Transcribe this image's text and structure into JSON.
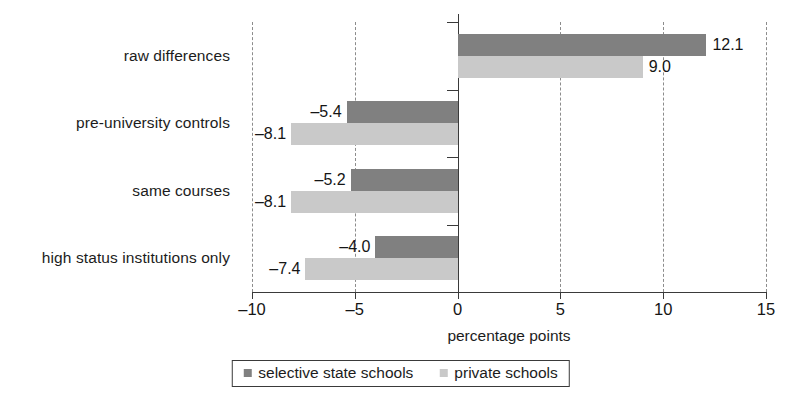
{
  "chart_data": {
    "type": "bar",
    "orientation": "horizontal",
    "title": "",
    "xlabel": "percentage points",
    "ylabel": "",
    "xlim": [
      -10,
      15
    ],
    "xticks": [
      -10,
      -5,
      0,
      5,
      10,
      15
    ],
    "xtick_labels": [
      "–10",
      "–5",
      "0",
      "5",
      "10",
      "15"
    ],
    "grid": "vertical-dashed",
    "legend_position": "bottom-center",
    "categories": [
      "raw differences",
      "pre-university controls",
      "same courses",
      "high status institutions only"
    ],
    "series": [
      {
        "name": "selective state schools",
        "color": "#808080",
        "values": [
          12.1,
          -5.4,
          -5.2,
          -4.0
        ],
        "value_labels": [
          "12.1",
          "–5.4",
          "–5.2",
          "–4.0"
        ]
      },
      {
        "name": "private schools",
        "color": "#c9c9c9",
        "values": [
          9.0,
          -8.1,
          -8.1,
          -7.4
        ],
        "value_labels": [
          "9.0",
          "–8.1",
          "–8.1",
          "–7.4"
        ]
      }
    ]
  },
  "axis": {
    "xlabel": "percentage points",
    "ticks": [
      {
        "value": -10,
        "label": "–10"
      },
      {
        "value": -5,
        "label": "–5"
      },
      {
        "value": 0,
        "label": "0"
      },
      {
        "value": 5,
        "label": "5"
      },
      {
        "value": 10,
        "label": "10"
      },
      {
        "value": 15,
        "label": "15"
      }
    ]
  },
  "categories": [
    {
      "label": "raw differences"
    },
    {
      "label": "pre-university controls"
    },
    {
      "label": "same courses"
    },
    {
      "label": "high status institutions only"
    }
  ],
  "bars": [
    {
      "group": 0,
      "series": "selective state schools",
      "value": 12.1,
      "label": "12.1",
      "tone": "dark"
    },
    {
      "group": 0,
      "series": "private schools",
      "value": 9.0,
      "label": "9.0",
      "tone": "light"
    },
    {
      "group": 1,
      "series": "selective state schools",
      "value": -5.4,
      "label": "–5.4",
      "tone": "dark"
    },
    {
      "group": 1,
      "series": "private schools",
      "value": -8.1,
      "label": "–8.1",
      "tone": "light"
    },
    {
      "group": 2,
      "series": "selective state schools",
      "value": -5.2,
      "label": "–5.2",
      "tone": "dark"
    },
    {
      "group": 2,
      "series": "private schools",
      "value": -8.1,
      "label": "–8.1",
      "tone": "light"
    },
    {
      "group": 3,
      "series": "selective state schools",
      "value": -4.0,
      "label": "–4.0",
      "tone": "dark"
    },
    {
      "group": 3,
      "series": "private schools",
      "value": -7.4,
      "label": "–7.4",
      "tone": "light"
    }
  ],
  "legend": {
    "items": [
      {
        "label": "selective state schools",
        "tone": "dark",
        "color": "#808080"
      },
      {
        "label": "private schools",
        "tone": "light",
        "color": "#c9c9c9"
      }
    ]
  },
  "colors": {
    "selective_state_schools": "#808080",
    "private_schools": "#c9c9c9",
    "axis": "#3a3a3a",
    "gridline": "#8c8c8c",
    "text": "#1c1c1c",
    "background": "#ffffff"
  }
}
